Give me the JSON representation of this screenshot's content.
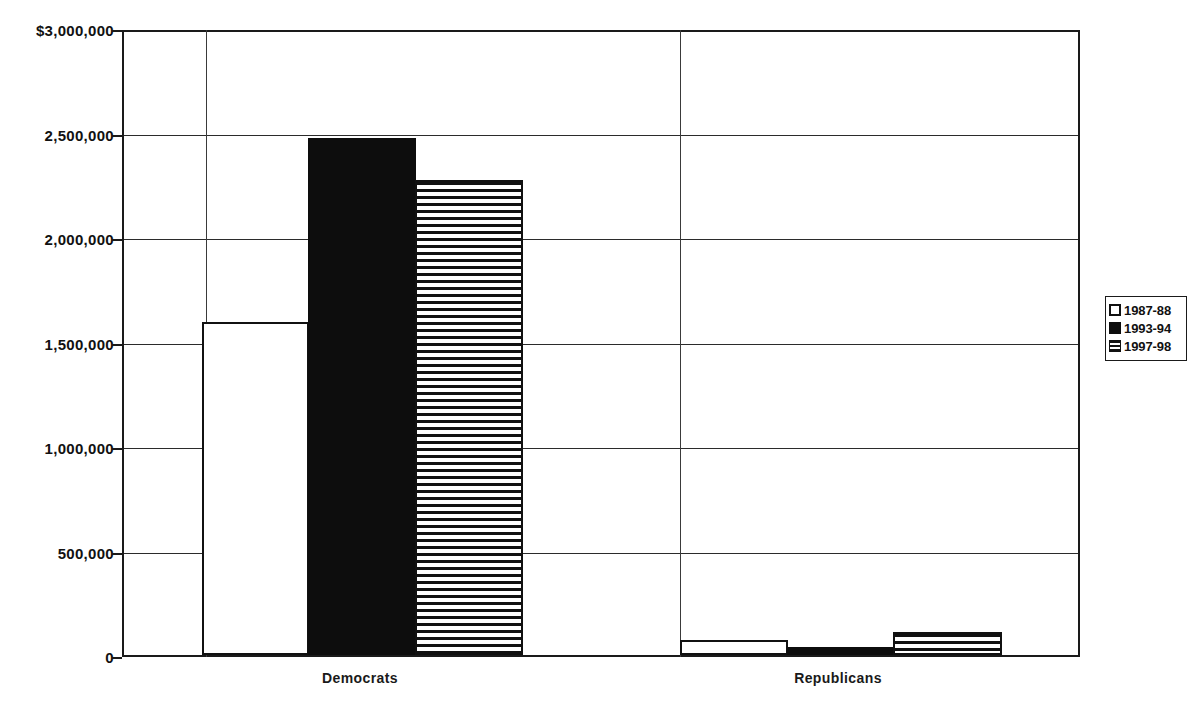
{
  "chart_data": {
    "type": "bar",
    "title": "",
    "xlabel": "",
    "ylabel": "",
    "categories": [
      "Democrats",
      "Republicans"
    ],
    "series": [
      {
        "name": "1987-88",
        "style": "white",
        "values": [
          1600000,
          70000
        ]
      },
      {
        "name": "1993-94",
        "style": "black",
        "values": [
          2480000,
          40000
        ]
      },
      {
        "name": "1997-98",
        "style": "striped",
        "values": [
          2280000,
          110000
        ]
      }
    ],
    "ylim": [
      0,
      3000000
    ],
    "ytick_values": [
      3000000,
      2500000,
      2000000,
      1500000,
      1000000,
      500000,
      0
    ],
    "ytick_labels": [
      "$3,000,000",
      "2,500,000",
      "2,000,000",
      "1,500,000",
      "1,000,000",
      "500,000",
      "0"
    ],
    "grid": true,
    "legend_position": "right"
  },
  "legend": {
    "items": [
      {
        "label": "1987-88",
        "swatch": "white-square-icon"
      },
      {
        "label": "1993-94",
        "swatch": "black-square-icon"
      },
      {
        "label": "1997-98",
        "swatch": "striped-square-icon"
      }
    ]
  },
  "axis": {
    "categories": [
      {
        "label": "Democrats"
      },
      {
        "label": "Republicans"
      }
    ]
  }
}
